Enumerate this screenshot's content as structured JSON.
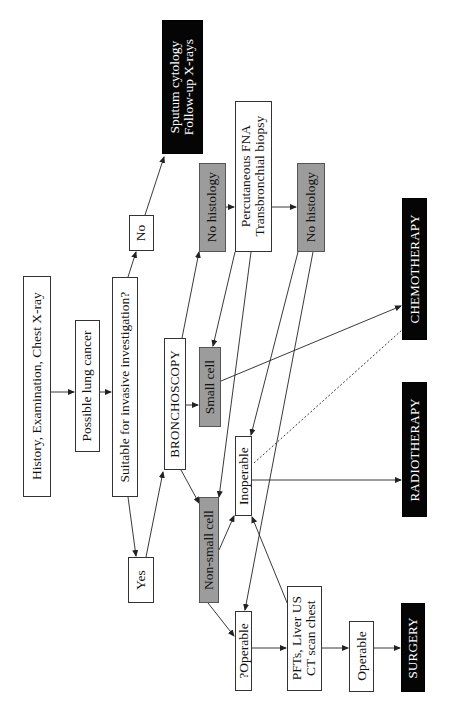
{
  "nodes": {
    "history": {
      "label": "History, Examination, Chest X-ray"
    },
    "possible": {
      "label": "Possible lung cancer"
    },
    "suitable": {
      "label": "Suitable for invasive investigation?"
    },
    "no": {
      "label": "No"
    },
    "yes": {
      "label": "Yes"
    },
    "sputum": {
      "line1": "Sputum cytology",
      "line2": "Follow-up X-rays"
    },
    "bronchoscopy": {
      "label": "BRONCHOSCOPY"
    },
    "no_histology_1": {
      "label": "No histology"
    },
    "percutaneous": {
      "line1": "Percutaneous FNA",
      "line2": "Transbronchial biopsy"
    },
    "no_histology_2": {
      "label": "No histology"
    },
    "small_cell": {
      "label": "Small cell"
    },
    "non_small_cell": {
      "label": "Non-small cell"
    },
    "inoperable": {
      "label": "Inoperable"
    },
    "q_operable": {
      "label": "?Operable"
    },
    "pfts": {
      "line1": "PFTs, Liver US",
      "line2": "CT scan chest"
    },
    "operable": {
      "label": "Operable"
    },
    "chemotherapy": {
      "label": "CHEMOTHERAPY"
    },
    "radiotherapy": {
      "label": "RADIOTHERAPY"
    },
    "surgery": {
      "label": "SURGERY"
    }
  },
  "colors": {
    "outcome_fill": "#050505",
    "histology_fill": "#9c9c9c",
    "step_fill": "#ffffff",
    "line": "#222222"
  }
}
